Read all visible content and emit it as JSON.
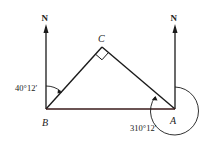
{
  "diagram": {
    "type": "bearing-triangle",
    "points": {
      "A": {
        "label": "A"
      },
      "B": {
        "label": "B"
      },
      "C": {
        "label": "C"
      }
    },
    "north_labels": {
      "at_B": "N",
      "at_A": "N"
    },
    "angles": {
      "bearing_B_to_C": "40°12′",
      "bearing_A_to_C": "310°12′",
      "right_angle_at": "C"
    },
    "colors": {
      "line": "#1a1a1a",
      "background": "#ffffff"
    }
  }
}
